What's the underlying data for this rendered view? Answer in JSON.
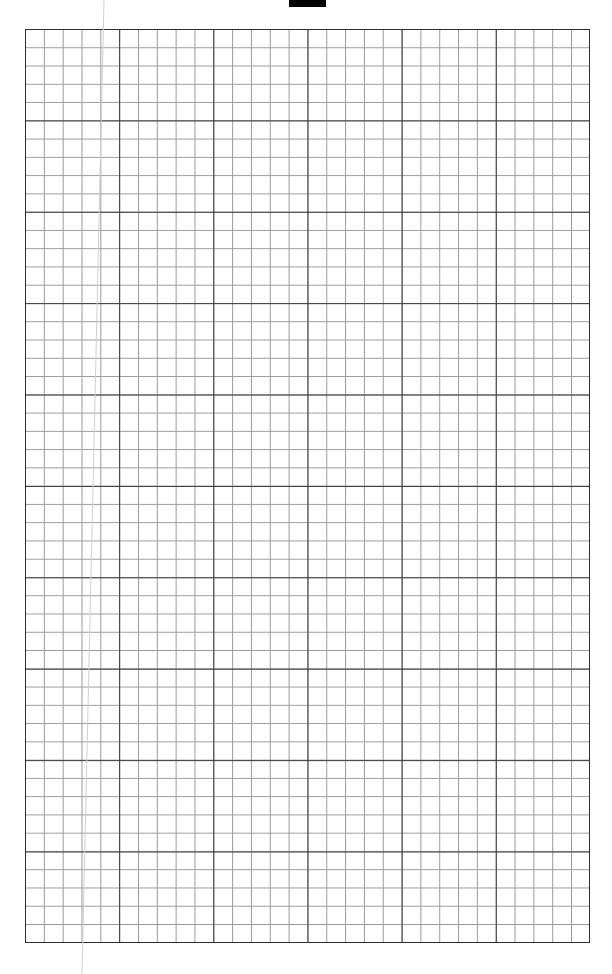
{
  "page": {
    "type": "graph-paper",
    "width": 612,
    "height": 974,
    "background": "#ffffff"
  },
  "header": {
    "text_fragments": [
      "",
      ""
    ],
    "tab_color": "#000000"
  },
  "grid": {
    "major_columns": 6,
    "major_rows": 10,
    "minor_per_major": 5,
    "total_columns": 30,
    "total_rows": 50,
    "major_line_color": "#3a3a3a",
    "minor_line_color": "#9a9a9a",
    "border_color": "#2e2e2e"
  },
  "fold_line": {
    "color": "#d0d0d0"
  }
}
